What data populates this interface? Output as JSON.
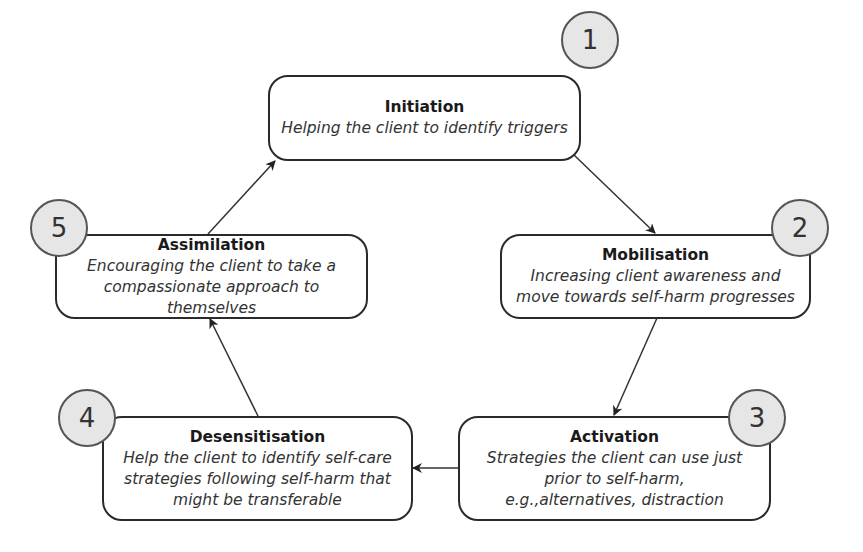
{
  "diagram": {
    "type": "cycle",
    "stages": [
      {
        "number": "1",
        "title": "Initiation",
        "description": "Helping the client to identify triggers"
      },
      {
        "number": "2",
        "title": "Mobilisation",
        "description": "Increasing client awareness and move towards self-harm progresses"
      },
      {
        "number": "3",
        "title": "Activation",
        "description": "Strategies the client can use just prior to self-harm, e.g.,alternatives, distraction"
      },
      {
        "number": "4",
        "title": "Desensitisation",
        "description": "Help the client to identify self-care strategies following self-harm that might be transferable"
      },
      {
        "number": "5",
        "title": "Assimilation",
        "description": "Encouraging the client to take a compassionate approach to themselves"
      }
    ],
    "edges": [
      {
        "from": "1",
        "to": "2"
      },
      {
        "from": "2",
        "to": "3"
      },
      {
        "from": "3",
        "to": "4"
      },
      {
        "from": "4",
        "to": "5"
      },
      {
        "from": "5",
        "to": "1"
      }
    ],
    "colors": {
      "border": "#2a2a2a",
      "circle_fill": "#e6e6e6",
      "circle_border": "#555555"
    }
  }
}
